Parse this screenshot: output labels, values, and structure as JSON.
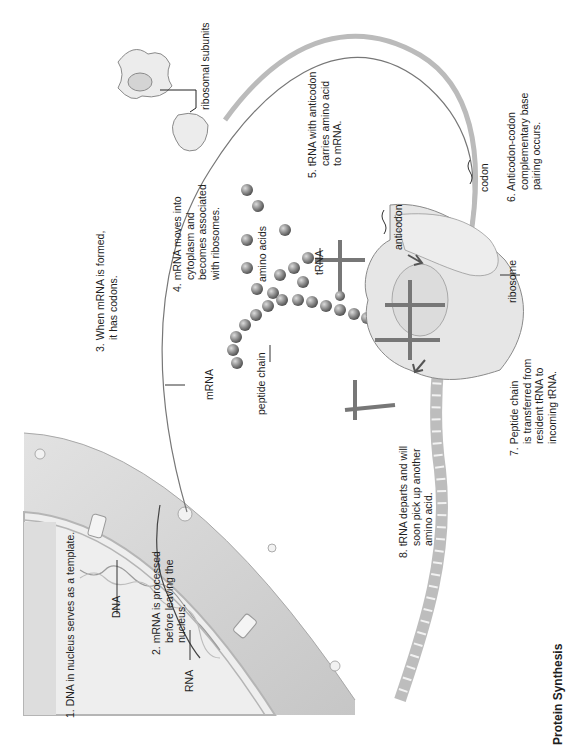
{
  "figure": {
    "title": "Protein Synthesis",
    "orientation": "rotated 90deg counter-clockwise"
  },
  "steps": [
    {
      "n": "1.",
      "lines": [
        "1. DNA in nucleus serves as a template."
      ]
    },
    {
      "n": "2.",
      "lines": [
        "2. mRNA is processed",
        "before leaving the",
        "nucleus."
      ]
    },
    {
      "n": "3.",
      "lines": [
        "3. When mRNA is formed,",
        "it has codons."
      ]
    },
    {
      "n": "4.",
      "lines": [
        "4. mRNA moves into",
        "cytoplasm and",
        "becomes associated",
        "with ribosomes."
      ]
    },
    {
      "n": "5.",
      "lines": [
        "5. tRNA with anticodon",
        "carries amino acid",
        "to mRNA."
      ]
    },
    {
      "n": "6.",
      "lines": [
        "6. Anticodon-codon",
        "complementary base",
        "pairing occurs."
      ]
    },
    {
      "n": "7.",
      "lines": [
        "7. Peptide chain",
        "is transferred from",
        "resident tRNA to",
        "incoming tRNA."
      ]
    },
    {
      "n": "8.",
      "lines": [
        "8. tRNA departs and will",
        "soon pick up another",
        "amino acid."
      ]
    }
  ],
  "labels": {
    "dna": "DNA",
    "rna": "RNA",
    "mrna": "mRNA",
    "peptide_chain": "peptide chain",
    "amino_acids": "amino acids",
    "trna": "tRNA",
    "anticodon": "anticodon",
    "codon": "codon",
    "ribosome": "ribosome",
    "ribosomal_subunits": "ribosomal subunits"
  },
  "colors": {
    "nucleus_fill": "#e9e9e9",
    "envelope": "#cfcfcf",
    "ribosome": "#e4e4e4",
    "amino_acid": "#8e8e8e",
    "trna": "#7a7a7a",
    "line": "#333333"
  }
}
